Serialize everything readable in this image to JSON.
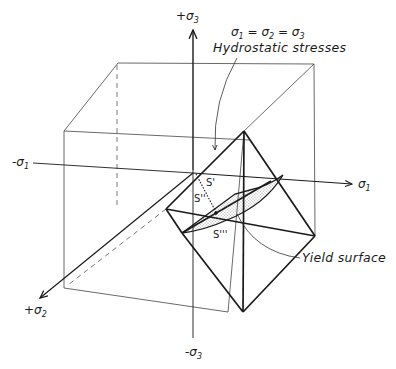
{
  "diagram": {
    "axes": {
      "pos_sigma3": {
        "sign": "+",
        "symbol": "σ",
        "sub": "3"
      },
      "neg_sigma3": {
        "sign": "-",
        "symbol": "σ",
        "sub": "3"
      },
      "pos_sigma1": {
        "sign": "",
        "symbol": "σ",
        "sub": "1"
      },
      "neg_sigma1": {
        "sign": "-",
        "symbol": "σ",
        "sub": "1"
      },
      "pos_sigma2": {
        "sign": "+",
        "symbol": "σ",
        "sub": "2"
      }
    },
    "annotations": {
      "hydrostatic_equation": {
        "s1": "σ",
        "sub1": "1",
        "eq1": " = ",
        "s2": "σ",
        "sub2": "2",
        "eq2": " = ",
        "s3": "σ",
        "sub3": "3"
      },
      "hydrostatic_label": "Hydrostatic   stresses",
      "yield_label": "Yield  surface"
    },
    "points": {
      "s_prime": "S'",
      "s_double_prime": "S''",
      "s_triple_prime": "S'''"
    },
    "colors": {
      "ink": "#1a1a1a",
      "thin_line": "#444444",
      "background": "#ffffff"
    }
  }
}
